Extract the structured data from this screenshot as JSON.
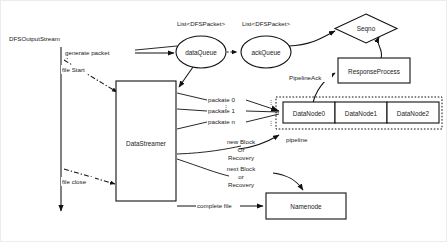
{
  "diagram": {
    "title_labels": {
      "dfs_output_stream": "DFSOutputStream",
      "data_queue_type": "List<DFSPacket>",
      "ack_queue_type": "List<DFSPacket>"
    },
    "nodes": {
      "data_queue": "dataQueue",
      "ack_queue": "ackQueue",
      "seqno": "Seqno",
      "response_process": "ResponseProcess",
      "data_streamer": "DataStreamer",
      "namenode": "Namenode",
      "datanode0": "DataNode0",
      "datanode1": "DataNode1",
      "datanode2": "DataNode2"
    },
    "edges": {
      "generate_packet": "generate packet",
      "file_start": "file Start",
      "file_close": "file close",
      "packate_0": "packate 0",
      "packate_1": "packate 1",
      "packate_n": "packate n",
      "ellipsis": "⋮",
      "pipeline_ack": "PipelineAck",
      "pipeline": "pipeline",
      "new_block_line1": "new Block",
      "new_block_line2": "Or",
      "new_block_line3": "Recovery",
      "next_block_line1": "next Block",
      "next_block_line2": "or",
      "next_block_line3": "Recovery",
      "complete_file": "complete file"
    },
    "colors": {
      "stroke": "#111111",
      "background": "#ffffff",
      "text": "#1a1a1a"
    }
  }
}
